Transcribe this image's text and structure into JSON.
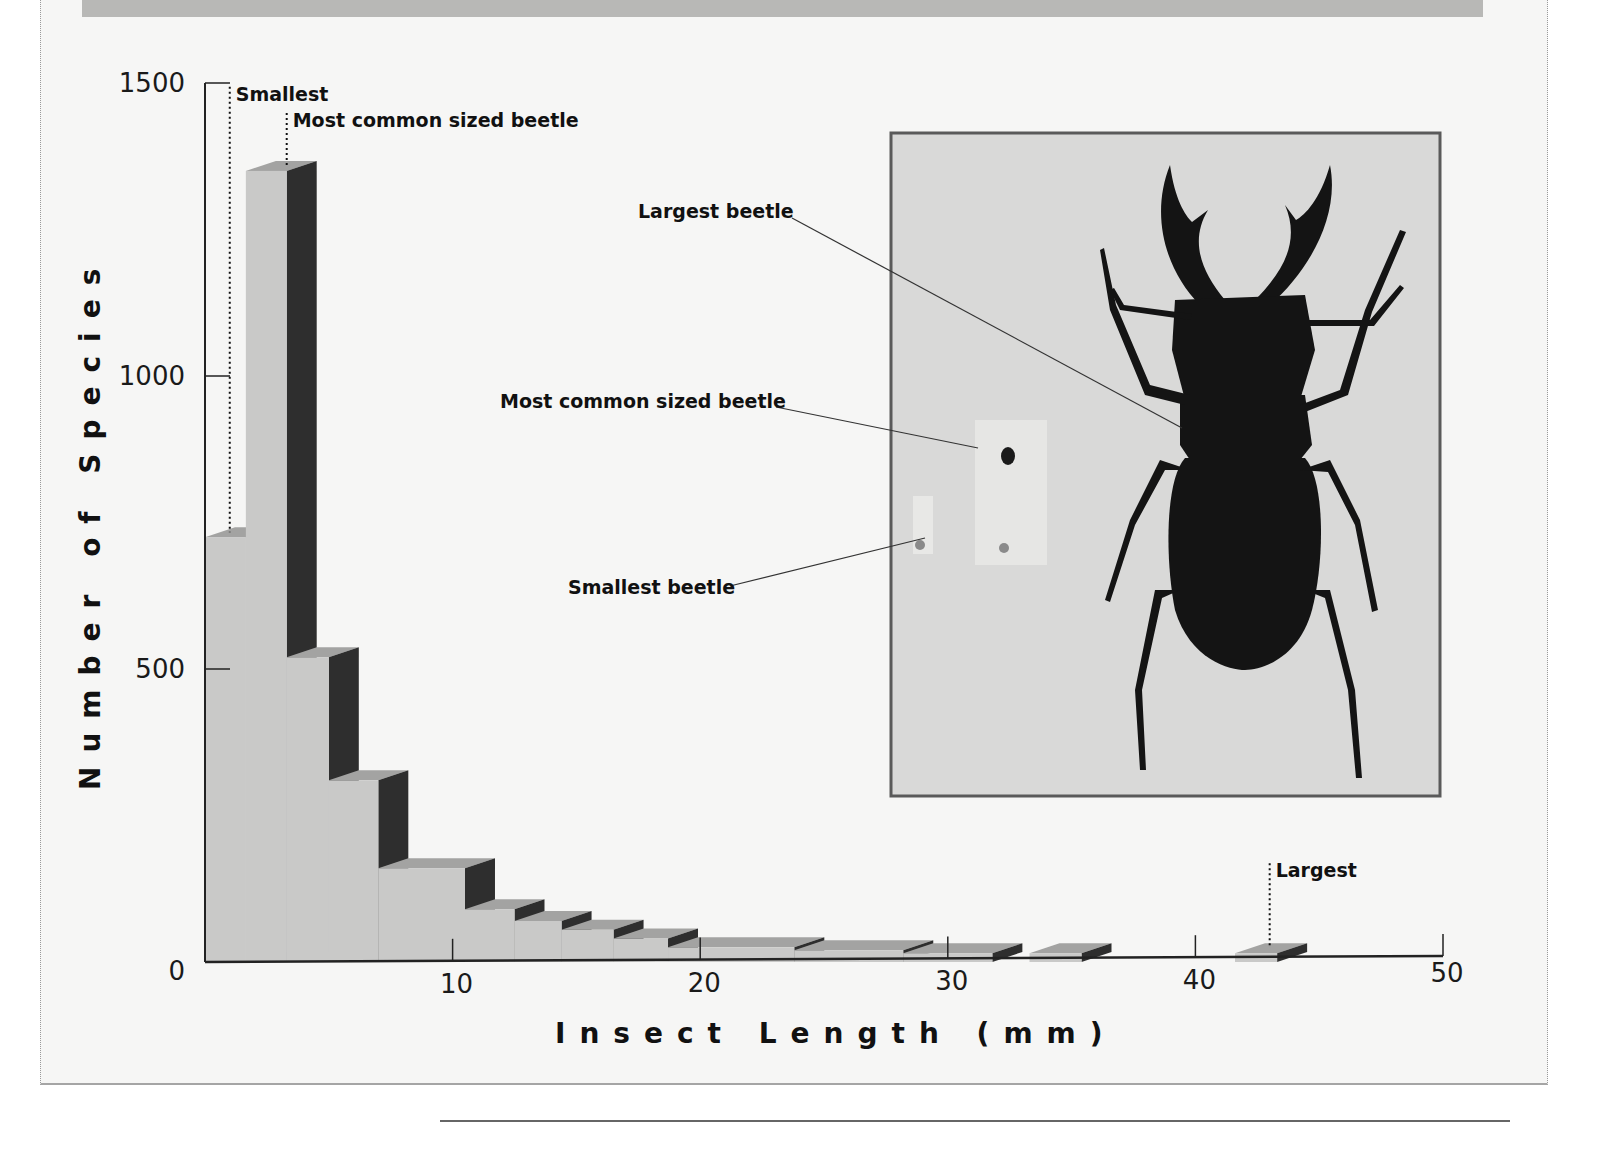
{
  "chart_data": {
    "type": "bar",
    "style": "3d-stepped-histogram",
    "title": "",
    "xlabel": "Insect Length (mm)",
    "ylabel": "Number of Species",
    "xlim": [
      0,
      50
    ],
    "ylim": [
      0,
      1500
    ],
    "x_ticks": [
      0,
      10,
      20,
      30,
      40,
      50
    ],
    "y_ticks": [
      0,
      500,
      1000,
      1500
    ],
    "grid": false,
    "legend": null,
    "bins": [
      {
        "x_start": 0.0,
        "x_end": 1.65,
        "value": 725
      },
      {
        "x_start": 1.65,
        "x_end": 3.3,
        "value": 1350
      },
      {
        "x_start": 3.3,
        "x_end": 5.0,
        "value": 520
      },
      {
        "x_start": 5.0,
        "x_end": 7.0,
        "value": 310
      },
      {
        "x_start": 7.0,
        "x_end": 10.5,
        "value": 160
      },
      {
        "x_start": 10.5,
        "x_end": 12.5,
        "value": 90
      },
      {
        "x_start": 12.5,
        "x_end": 14.4,
        "value": 70
      },
      {
        "x_start": 14.4,
        "x_end": 16.5,
        "value": 55
      },
      {
        "x_start": 16.5,
        "x_end": 18.7,
        "value": 40
      },
      {
        "x_start": 18.7,
        "x_end": 23.8,
        "value": 25
      },
      {
        "x_start": 23.8,
        "x_end": 28.2,
        "value": 20
      },
      {
        "x_start": 28.2,
        "x_end": 31.8,
        "value": 15
      },
      {
        "x_start": 33.3,
        "x_end": 35.4,
        "value": 15
      },
      {
        "x_start": 41.6,
        "x_end": 43.3,
        "value": 15
      }
    ],
    "annotations": [
      {
        "label": "Smallest",
        "x": 1.0,
        "label_y": 1480
      },
      {
        "label": "Most common sized beetle",
        "x": 3.3,
        "label_y": 1435
      },
      {
        "label": "Largest",
        "x": 43.0,
        "label_y": 155
      }
    ]
  },
  "inset_photo": {
    "labels": {
      "largest": "Largest beetle",
      "most_common": "Most common sized beetle",
      "smallest": "Smallest beetle"
    }
  },
  "colors": {
    "bar_front": "#c9c9c8",
    "bar_top": "#a3a3a2",
    "bar_side": "#2e2e2e",
    "axis": "#222222",
    "photo_bg": "#d9d9d8",
    "photo_border": "#5a5a5a",
    "beetle": "#141414"
  }
}
